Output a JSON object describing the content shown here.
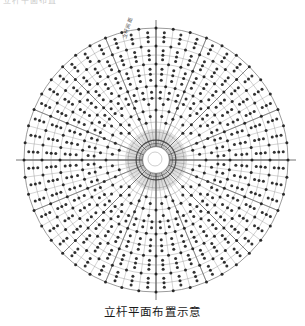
{
  "page": {
    "background_color": "#ffffff",
    "top_clipped_text": "立杆平面布置",
    "caption": "立杆平面布置示意"
  },
  "drawing": {
    "title": "立杆平面布置示意",
    "type": "radial-scaffold-plan",
    "annotation_label": "立杆间距",
    "colors": {
      "rib_line": "#8a8a8a",
      "ring_line": "#8a8a8a",
      "major_axis": "#6f6f6f",
      "node_dot": "#1c1c1c",
      "hub_core": "#ffffff",
      "outline": "#6b6b6b"
    }
  },
  "chart_data": {
    "type": "scatter",
    "title": "立杆平面布置示意",
    "xlabel": "",
    "ylabel": "",
    "coordinate_system": "polar",
    "center_px": [
      156,
      160
    ],
    "outer_radius_px": 132,
    "radial_ribs": 48,
    "rib_angle_step_deg": 7.5,
    "rings": 13,
    "ring_radii_px": [
      14,
      20,
      28,
      38,
      50,
      62,
      74,
      86,
      96,
      105,
      114,
      123,
      132
    ],
    "major_axis_angles_deg": [
      0,
      90,
      180,
      270
    ],
    "sector_divider_angles_deg": [
      0,
      22.5,
      45,
      67.5,
      90,
      112.5,
      135,
      157.5,
      180,
      202.5,
      225,
      247.5,
      270,
      292.5,
      315,
      337.5
    ],
    "node_dot_radius_px": 1.5,
    "node_count_approx": 560,
    "grid": true,
    "legend": "none"
  }
}
